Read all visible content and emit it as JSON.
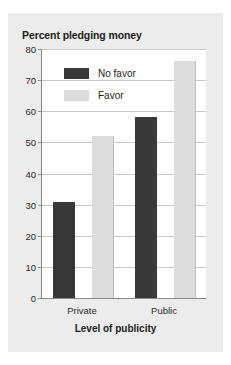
{
  "chart_data": {
    "type": "bar",
    "title": "Percent pledging money",
    "xlabel": "Level of publicity",
    "ylabel": "",
    "categories": [
      "Private",
      "Public"
    ],
    "series": [
      {
        "name": "No favor",
        "values": [
          31,
          58
        ],
        "color": "#383838"
      },
      {
        "name": "Favor",
        "values": [
          52,
          76
        ],
        "color": "#dcdcdc"
      }
    ],
    "ylim": [
      0,
      80
    ],
    "yticks": [
      0,
      10,
      20,
      30,
      40,
      50,
      60,
      70,
      80
    ],
    "ytick_labels": [
      "0",
      "10",
      "20",
      "30",
      "40",
      "50",
      "60",
      "70",
      "80"
    ],
    "grid": true,
    "legend_position": "top-left-inside"
  },
  "colors": {
    "page_background": "#ffffff",
    "card_background": "#ececec",
    "plot_background": "#ffffff",
    "axis": "#8a8a8a",
    "gridline": "#c9c9c9",
    "text": "#1b1b1b",
    "no_favor": "#383838",
    "favor": "#dcdcdc"
  }
}
